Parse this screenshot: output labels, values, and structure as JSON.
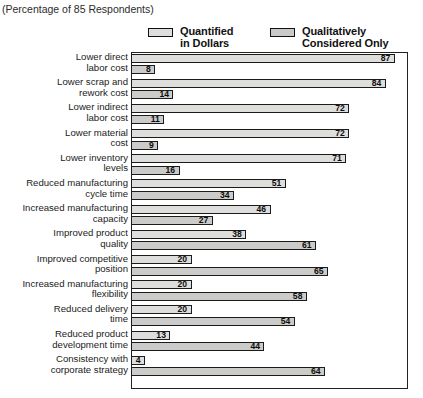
{
  "title": "ON THE LEAN ENTERPRISE",
  "subtitle": "(Percentage of 85 Respondents)",
  "legend": [
    {
      "label_line1": "Quantified",
      "label_line2": "in Dollars",
      "color": "#dededc",
      "name": "quantified-in-dollars"
    },
    {
      "label_line1": "Qualitatively",
      "label_line2": "Considered Only",
      "color": "#cbcbc9",
      "name": "qualitatively-considered-only"
    }
  ],
  "chart_data": {
    "type": "bar",
    "orientation": "horizontal",
    "title": "ON THE LEAN ENTERPRISE",
    "subtitle": "(Percentage of 85 Respondents)",
    "xlabel": "",
    "ylabel": "",
    "xlim": [
      0,
      90
    ],
    "grid": false,
    "legend_position": "top",
    "categories": [
      "Lower direct labor cost",
      "Lower scrap and rework cost",
      "Lower indirect labor cost",
      "Lower material cost",
      "Lower inventory levels",
      "Reduced manufacturing cycle time",
      "Increased manufacturing capacity",
      "Improved product quality",
      "Improved competitive position",
      "Increased manufacturing flexibility",
      "Reduced delivery time",
      "Reduced product development time",
      "Consistency with corporate strategy"
    ],
    "series": [
      {
        "name": "Quantified in Dollars",
        "values": [
          87,
          84,
          72,
          72,
          71,
          51,
          46,
          38,
          20,
          20,
          20,
          13,
          4
        ]
      },
      {
        "name": "Qualitatively Considered Only",
        "values": [
          8,
          14,
          11,
          9,
          16,
          34,
          27,
          61,
          65,
          58,
          54,
          44,
          64
        ]
      }
    ]
  },
  "rows": [
    {
      "l1": "Lower direct",
      "l2": "labor cost",
      "v0": 87,
      "v1": 8
    },
    {
      "l1": "Lower scrap and",
      "l2": "rework cost",
      "v0": 84,
      "v1": 14
    },
    {
      "l1": "Lower indirect",
      "l2": "labor cost",
      "v0": 72,
      "v1": 11
    },
    {
      "l1": "Lower material",
      "l2": "cost",
      "v0": 72,
      "v1": 9
    },
    {
      "l1": "Lower inventory",
      "l2": "levels",
      "v0": 71,
      "v1": 16
    },
    {
      "l1": "Reduced manufacturing",
      "l2": "cycle time",
      "v0": 51,
      "v1": 34
    },
    {
      "l1": "Increased manufacturing",
      "l2": "capacity",
      "v0": 46,
      "v1": 27
    },
    {
      "l1": "Improved product",
      "l2": "quality",
      "v0": 38,
      "v1": 61
    },
    {
      "l1": "Improved competitive",
      "l2": "position",
      "v0": 20,
      "v1": 65
    },
    {
      "l1": "Increased manufacturing",
      "l2": "flexibility",
      "v0": 20,
      "v1": 58
    },
    {
      "l1": "Reduced delivery",
      "l2": "time",
      "v0": 20,
      "v1": 54
    },
    {
      "l1": "Reduced product",
      "l2": "development time",
      "v0": 13,
      "v1": 44
    },
    {
      "l1": "Consistency with",
      "l2": "corporate strategy",
      "v0": 4,
      "v1": 64
    }
  ]
}
